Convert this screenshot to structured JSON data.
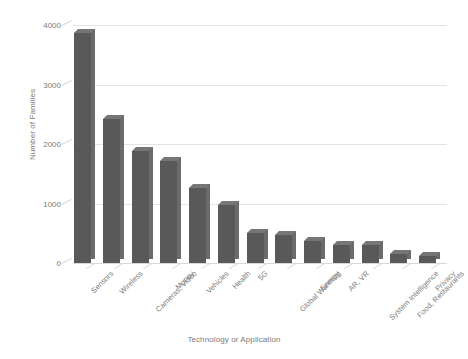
{
  "chart_data": {
    "type": "bar",
    "title": "",
    "xlabel": "Technology or Application",
    "ylabel": "Number of Families",
    "categories": [
      "Sensors",
      "Wireless",
      "Cameras, Video",
      "Money",
      "Vehicles",
      "Health",
      "5G",
      "Global Warming",
      "Energy",
      "AR, VR",
      "System Intelligence",
      "Food, Restaurants",
      "Privacy"
    ],
    "values": [
      3870,
      2420,
      1880,
      1710,
      1260,
      980,
      500,
      470,
      370,
      300,
      300,
      150,
      120
    ],
    "ylim": [
      0,
      4000
    ],
    "yticks": [
      0,
      1000,
      2000,
      3000,
      4000
    ],
    "ytick_labels": [
      "0",
      "1000",
      "2000",
      "3000",
      "4000"
    ],
    "grid": "horizontal",
    "legend": "none",
    "bar_color": "#595959",
    "bar_side_color": "#6b6b6b",
    "bar_top_color": "#767676",
    "gridline_color": "#e4e4e4",
    "text_color": "#7b7b7b",
    "background": "#ffffff"
  }
}
